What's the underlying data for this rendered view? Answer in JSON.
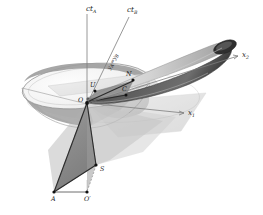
{
  "figure": {
    "background_color": "#ffffff",
    "ink_color": "#1a1a1a"
  },
  "axes": [
    {
      "id": "ct-a",
      "label": "ct",
      "subscript": "A",
      "x1": 87,
      "y1": 103,
      "x2": 87,
      "y2": 14
    },
    {
      "id": "ct-b",
      "label": "ct",
      "subscript": "B",
      "x1": 87,
      "y1": 103,
      "x2": 129,
      "y2": 16
    },
    {
      "id": "x-2",
      "label": "x",
      "subscript": "2",
      "x1": 87,
      "y1": 103,
      "x2": 239,
      "y2": 56
    },
    {
      "id": "x-1",
      "label": "x",
      "subscript": "1",
      "x1": 87,
      "y1": 103,
      "x2": 184,
      "y2": 113
    }
  ],
  "axis_labels": [
    {
      "name": "axis-label-ct-a",
      "base": "ct",
      "sub": "A",
      "x": 86,
      "y": 11
    },
    {
      "name": "axis-label-ct-b",
      "base": "ct",
      "sub": "B",
      "x": 127,
      "y": 12
    },
    {
      "name": "axis-label-x-2",
      "base": "x",
      "sub": "2",
      "x": 242,
      "y": 56
    },
    {
      "name": "axis-label-x-1",
      "base": "x",
      "sub": "1",
      "x": 188,
      "y": 114
    }
  ],
  "points": [
    {
      "name": "point-o",
      "label": "O",
      "prime": false,
      "px": 87,
      "py": 103,
      "lx": 79,
      "ly": 101,
      "marker": true
    },
    {
      "name": "point-u",
      "label": "U",
      "prime": false,
      "px": 95,
      "py": 91,
      "lx": 90,
      "ly": 86,
      "marker": true
    },
    {
      "name": "point-n",
      "label": "N",
      "prime": false,
      "px": 133,
      "py": 80,
      "lx": 126,
      "ly": 76,
      "marker": true
    },
    {
      "name": "point-c",
      "label": "C",
      "prime": false,
      "px": 126,
      "py": 95,
      "lx": 123,
      "ly": 90,
      "marker": true
    },
    {
      "name": "point-s",
      "label": "S",
      "prime": false,
      "px": 96,
      "py": 165,
      "lx": 100,
      "ly": 170,
      "marker": true
    },
    {
      "name": "point-a",
      "label": "A",
      "prime": false,
      "px": 54,
      "py": 192,
      "lx": 52,
      "ly": 200,
      "marker": true
    },
    {
      "name": "point-o-prime",
      "label": "O",
      "prime": true,
      "px": 87,
      "py": 192,
      "lx": 86,
      "ly": 200,
      "marker": true
    }
  ],
  "annotations": [
    {
      "name": "y-equality-label",
      "text": "y",
      "sub1": "A",
      "eq": "=",
      "text2": "y",
      "sub2": "B",
      "x": 110,
      "y": 70,
      "rotation": -63
    }
  ],
  "shapes": {
    "cone_fill": "#b9b9b9",
    "cone_top_fill": "#f4f4f4",
    "tube_light_fill": "#d9d9d9",
    "tube_dark_fill": "#4f4f4f",
    "tube_cap_fill": "#3a3a3a",
    "lower_wedge_fill": "#8f8f8f",
    "lower_wedge_fill_2": "#a8a8a8",
    "ground_fill": "#cfcfcf",
    "hyperplane_fill": "#e3e3e3"
  },
  "colors": {
    "axis": "#7d7d7d",
    "edge_dark": "#2b2b2b",
    "edge_mid": "#666666",
    "edge_light": "#9a9a9a",
    "dot": "#111111",
    "dashed": "#8a8a8a"
  }
}
